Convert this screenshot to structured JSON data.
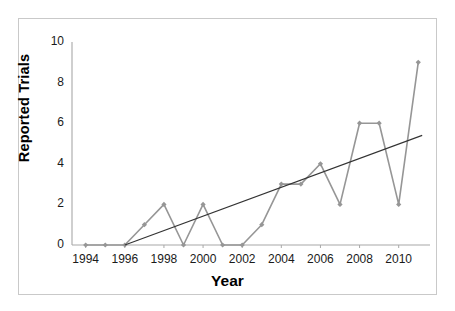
{
  "chart_data": {
    "type": "line",
    "title": "",
    "xlabel": "Year",
    "ylabel": "Reported Trials",
    "x": [
      1994,
      1995,
      1996,
      1997,
      1998,
      1999,
      2000,
      2001,
      2002,
      2003,
      2004,
      2005,
      2006,
      2007,
      2008,
      2009,
      2010,
      2011
    ],
    "values": [
      0,
      0,
      0,
      1,
      2,
      0,
      2,
      0,
      0,
      1,
      3,
      3,
      4,
      2,
      6,
      6,
      2,
      9
    ],
    "series": [
      {
        "name": "Reported Trials",
        "values": [
          0,
          0,
          0,
          1,
          2,
          0,
          2,
          0,
          0,
          1,
          3,
          3,
          4,
          2,
          6,
          6,
          2,
          9
        ],
        "color": "#969696",
        "marker": "diamond"
      },
      {
        "name": "Linear trend",
        "type": "trendline",
        "x_start": 1996.0,
        "y_start": 0.0,
        "x_end": 2011.2,
        "y_end": 5.4,
        "color": "#333333"
      }
    ],
    "xlim": [
      1993.3,
      2011.6
    ],
    "ylim": [
      0,
      10
    ],
    "xticks": [
      1994,
      1996,
      1998,
      2000,
      2002,
      2004,
      2006,
      2008,
      2010
    ],
    "xtick_labels": [
      "1994",
      "1996",
      "1998",
      "2000",
      "2002",
      "2004",
      "2006",
      "2008",
      "2010"
    ],
    "yticks": [
      0,
      2,
      4,
      6,
      8,
      10
    ],
    "ytick_labels": [
      "0",
      "2",
      "4",
      "6",
      "8",
      "10"
    ],
    "grid": false,
    "legend": "none",
    "axis_color": "#a8a8a8",
    "frame_color": "#c9c9c9",
    "background": "#ffffff"
  }
}
